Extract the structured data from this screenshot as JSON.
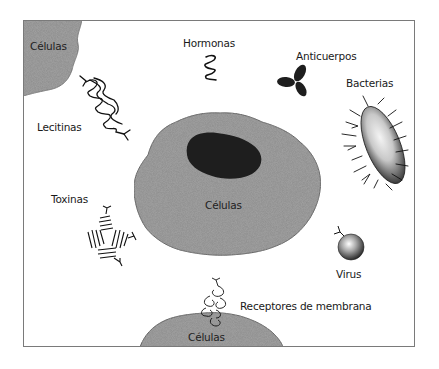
{
  "diagram": {
    "type": "cell-binding-targets",
    "colors": {
      "cell_fill": "#8c8c8c",
      "nucleus_fill": "#1e1e1e",
      "frame_border": "#7a7a7a",
      "text": "#1a1a1a",
      "background": "#ffffff"
    },
    "labels": {
      "cells_top_left": "Células",
      "cells_center": "Células",
      "cells_bottom": "Células",
      "hormones": "Hormonas",
      "antibodies": "Anticuerpos",
      "bacteria": "Bacterias",
      "lectins": "Lecitinas",
      "toxins": "Toxinas",
      "virus": "Virus",
      "membrane_receptors": "Receptores de membrana"
    }
  }
}
